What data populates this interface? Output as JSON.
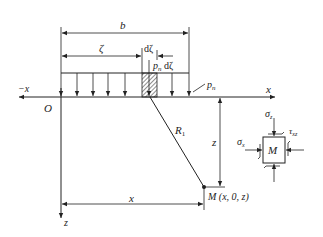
{
  "diagram": {
    "type": "mechanics-schematic",
    "labels": {
      "b": "b",
      "zeta": "ζ",
      "dzeta": "dζ",
      "load_element": "p",
      "load_element_sub": "n",
      "load_element_suffix": " dζ",
      "pressure": "p",
      "pressure_sub": "n",
      "neg_x_axis": "−x",
      "x_axis": "x",
      "origin": "O",
      "z_axis": "z",
      "distance_R": "R",
      "distance_R_sub": "1",
      "depth_z": "z",
      "horizontal_x": "x",
      "point_M": "M (x, 0, z)",
      "sigma_z": "σ",
      "sigma_z_sub": "z",
      "tau_xz": "τ",
      "tau_xz_sub": "xz",
      "sigma_x": "σ",
      "sigma_x_sub": "x",
      "element_M": "M"
    },
    "colors": {
      "line": "#222222",
      "background": "#ffffff"
    }
  }
}
